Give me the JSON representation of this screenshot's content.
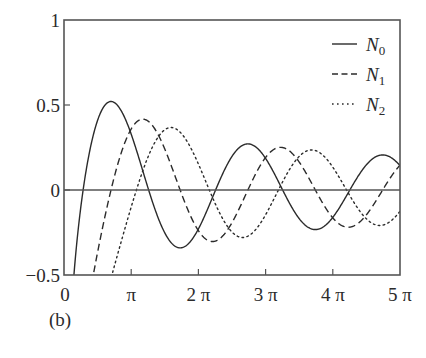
{
  "panel_label": "(b)",
  "chart_data": {
    "type": "line",
    "title": "",
    "xlabel": "",
    "ylabel": "",
    "xlim": [
      0,
      15.70796
    ],
    "ylim": [
      -0.5,
      1
    ],
    "grid": false,
    "legend_position": "upper right",
    "x_ticks": [
      {
        "value": 0,
        "label": "0"
      },
      {
        "value": 3.14159,
        "label": "π"
      },
      {
        "value": 6.28319,
        "label": "2 π"
      },
      {
        "value": 9.42478,
        "label": "3 π"
      },
      {
        "value": 12.56637,
        "label": "4 π"
      },
      {
        "value": 15.70796,
        "label": "5 π"
      }
    ],
    "y_ticks": [
      {
        "value": -0.5,
        "label": "−0.5"
      },
      {
        "value": 0,
        "label": "0"
      },
      {
        "value": 0.5,
        "label": "0.5"
      },
      {
        "value": 1,
        "label": "1"
      }
    ],
    "zero_line": true,
    "series": [
      {
        "name": "N0",
        "base": "N",
        "sub": "0",
        "order": 0,
        "style": "solid",
        "key_points": [
          {
            "x": 0.45,
            "y": -0.5
          },
          {
            "x": 0.894,
            "y": 0.0
          },
          {
            "x": 2.197,
            "y": 0.52
          },
          {
            "x": 3.958,
            "y": 0.0
          },
          {
            "x": 5.43,
            "y": -0.34
          },
          {
            "x": 7.086,
            "y": 0.0
          },
          {
            "x": 8.596,
            "y": 0.27
          },
          {
            "x": 10.222,
            "y": 0.0
          },
          {
            "x": 11.749,
            "y": -0.23
          },
          {
            "x": 13.361,
            "y": 0.0
          },
          {
            "x": 14.897,
            "y": 0.21
          },
          {
            "x": 15.708,
            "y": 0.13
          }
        ]
      },
      {
        "name": "N1",
        "base": "N",
        "sub": "1",
        "order": 1,
        "style": "dashed",
        "key_points": [
          {
            "x": 1.45,
            "y": -0.5
          },
          {
            "x": 2.197,
            "y": 0.0
          },
          {
            "x": 3.683,
            "y": 0.42
          },
          {
            "x": 5.43,
            "y": 0.0
          },
          {
            "x": 6.942,
            "y": -0.3
          },
          {
            "x": 8.596,
            "y": 0.0
          },
          {
            "x": 10.024,
            "y": 0.25
          },
          {
            "x": 11.749,
            "y": 0.0
          },
          {
            "x": 13.21,
            "y": -0.21
          },
          {
            "x": 14.897,
            "y": 0.0
          },
          {
            "x": 15.708,
            "y": 0.15
          }
        ]
      },
      {
        "name": "N2",
        "base": "N",
        "sub": "2",
        "order": 2,
        "style": "dotted",
        "key_points": [
          {
            "x": 2.35,
            "y": -0.5
          },
          {
            "x": 3.384,
            "y": 0.0
          },
          {
            "x": 5.002,
            "y": 0.37
          },
          {
            "x": 6.794,
            "y": 0.0
          },
          {
            "x": 8.35,
            "y": -0.28
          },
          {
            "x": 10.024,
            "y": 0.0
          },
          {
            "x": 11.396,
            "y": 0.24
          },
          {
            "x": 13.21,
            "y": 0.0
          },
          {
            "x": 14.6,
            "y": -0.2
          },
          {
            "x": 15.708,
            "y": -0.13
          }
        ]
      }
    ]
  },
  "colors": {
    "line": "#2b2b2b",
    "axis": "#555555",
    "background": "#ffffff"
  }
}
